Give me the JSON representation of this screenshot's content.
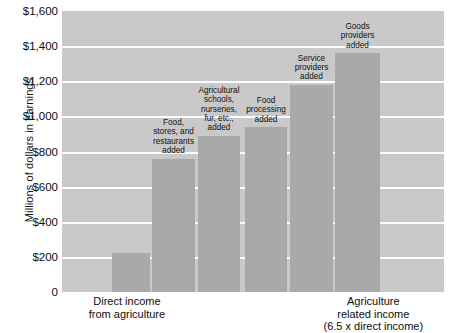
{
  "chart_data": {
    "type": "bar",
    "title": "",
    "xlabel": "",
    "ylabel": "Millions of dollars in earnings",
    "ylim": [
      0,
      1600
    ],
    "ytick_labels": [
      "$1,600",
      "$1,400",
      "$1,200",
      "$1,000",
      "$800",
      "$600",
      "$400",
      "$200",
      "0"
    ],
    "ytick_values": [
      1600,
      1400,
      1200,
      1000,
      800,
      600,
      400,
      200,
      0
    ],
    "grid": true,
    "legend": "none",
    "categories": [
      "Direct income from agriculture",
      "Food, stores, and restaurants added",
      "Agricultural schools, nurseries, fur, etc., added",
      "Food processing added",
      "Service providers added",
      "Goods providers added"
    ],
    "values": [
      220,
      760,
      890,
      940,
      1180,
      1360
    ],
    "bar_labels": [
      "",
      "Food,\nstores, and\nrestaurants\nadded",
      "Agricultural\nschools,\nnurseries,\nfur, etc.,\nadded",
      "Food\nprocessing\nadded",
      "Service\nproviders\nadded",
      "Goods\nproviders\nadded"
    ],
    "x_axis_labels": [
      {
        "text": "Direct income\nfrom agriculture",
        "center_pct": 17.0
      },
      {
        "text": "Agriculture\nrelated income\n(6.5 x direct income)",
        "center_pct": 81.5
      }
    ],
    "colors": {
      "plot_background": "#c9c9c9",
      "bar_fill": "#a9a9a9",
      "gridline": "#fdfdfd",
      "text": "#0d0d0d",
      "page_background": "#ffffff"
    }
  }
}
